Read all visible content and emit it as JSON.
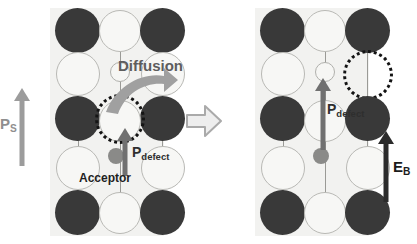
{
  "figure": {
    "type": "schematic-diagram",
    "background": "#ffffff"
  },
  "colors": {
    "a_site_dark": "#393939",
    "a_site_light": "#f7f7f5",
    "lattice_bg": "#f2f2f0",
    "acceptor": "#8a8a88",
    "vacancy_outline": "#141414",
    "ps_arrow": "#9c9c9c",
    "pdefect_arrow": "#707070",
    "eb_arrow": "#2b2b2b",
    "diffusion_arrow": "#a0a0a0",
    "transition_arrow": "#b5b5b5"
  },
  "panels": [
    {
      "id": "before",
      "name": "left-panel",
      "labels": {
        "ps": "P",
        "ps_sub": "S",
        "pdefect": "P",
        "pdefect_sub": "defect",
        "acceptor": "Acceptor",
        "diffusion": "Diffusion"
      },
      "lattice": {
        "columns": 3,
        "rows": 5,
        "pattern": [
          [
            "dark",
            "light",
            "dark"
          ],
          [
            "light",
            "light",
            "light"
          ],
          [
            "dark",
            "vacancy",
            "dark"
          ],
          [
            "light",
            "light",
            "light"
          ],
          [
            "dark",
            "light",
            "dark"
          ]
        ]
      },
      "features": {
        "b_site_small_circle": "row2-center",
        "vacancy_position": "row3-center",
        "acceptor_position": "below-vacancy",
        "ps_direction": "up",
        "pdefect_direction": "up"
      }
    },
    {
      "id": "after",
      "name": "right-panel",
      "labels": {
        "pdefect": "P",
        "pdefect_sub": "defect",
        "eb": "E",
        "eb_sub": "B"
      },
      "lattice": {
        "columns": 3,
        "rows": 5,
        "pattern": [
          [
            "dark",
            "light",
            "dark"
          ],
          [
            "light",
            "light",
            "vacancy"
          ],
          [
            "dark",
            "light",
            "dark"
          ],
          [
            "light",
            "light",
            "light"
          ],
          [
            "dark",
            "light",
            "dark"
          ]
        ]
      },
      "features": {
        "b_site_small_circle": "row2-center",
        "vacancy_position": "row2-right",
        "acceptor_position": "row4-center",
        "pdefect_direction": "up",
        "eb_direction": "up"
      }
    }
  ],
  "transition": {
    "name": "transition-arrow",
    "direction": "right",
    "meaning": "left state evolves to right state"
  }
}
